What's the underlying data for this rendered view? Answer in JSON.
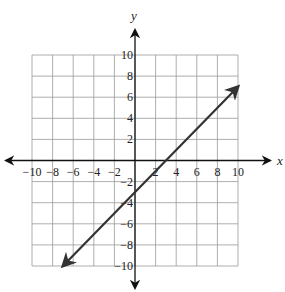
{
  "chart_data": {
    "type": "line",
    "title": "",
    "xlabel": "x",
    "ylabel": "y",
    "xlim": [
      -10,
      10
    ],
    "ylim": [
      -10,
      10
    ],
    "grid": true,
    "grid_step": 2,
    "x_ticks": [
      -10,
      -8,
      -6,
      -4,
      -2,
      2,
      4,
      6,
      8,
      10
    ],
    "y_ticks": [
      10,
      8,
      6,
      4,
      2,
      -2,
      -4,
      -6,
      -8,
      -10
    ],
    "x_tick_labels": [
      "−10",
      "−8",
      "−6",
      "−4",
      "−2",
      "2",
      "4",
      "6",
      "8",
      "10"
    ],
    "y_tick_labels": [
      "10",
      "8",
      "6",
      "4",
      "2",
      "−2",
      "−4",
      "−6",
      "−8",
      "−10"
    ],
    "series": [
      {
        "name": "y = x − 3",
        "equation": "y = x - 3",
        "slope": 1,
        "intercept": -3,
        "x": [
          -7,
          10
        ],
        "y": [
          -10,
          7
        ],
        "arrows": "both"
      }
    ],
    "legend": null
  },
  "colors": {
    "axis": "#111111",
    "grid": "#999999",
    "line": "#333333"
  }
}
